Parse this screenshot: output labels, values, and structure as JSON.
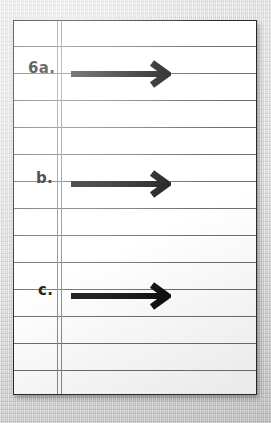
{
  "scene": {
    "surface_color": "#d6d6d6",
    "page_color": "#ffffff",
    "page_border_color": "#2b2b2b",
    "rule_color": "#6e6e6e",
    "margin_color": "#8a8a8a",
    "ink_color": "#111111"
  },
  "page": {
    "kind": "ruled-notebook-page",
    "rule_count": 14,
    "rule_spacing_px": 27,
    "first_rule_y_px": 25,
    "margin_lines_x_px": [
      43,
      47
    ]
  },
  "items": [
    {
      "label": "6a.",
      "label_x_px": 14,
      "label_y_px": 40,
      "arrow": {
        "name": "right-arrow",
        "start_x_px": 57,
        "end_x_px": 153,
        "y_px": 53,
        "thickness_px": 6
      }
    },
    {
      "label": "b.",
      "label_x_px": 22,
      "label_y_px": 150,
      "arrow": {
        "name": "right-arrow",
        "start_x_px": 57,
        "end_x_px": 153,
        "y_px": 163,
        "thickness_px": 6
      }
    },
    {
      "label": "c.",
      "label_x_px": 24,
      "label_y_px": 262,
      "arrow": {
        "name": "right-arrow",
        "start_x_px": 57,
        "end_x_px": 153,
        "y_px": 275,
        "thickness_px": 6
      }
    }
  ]
}
